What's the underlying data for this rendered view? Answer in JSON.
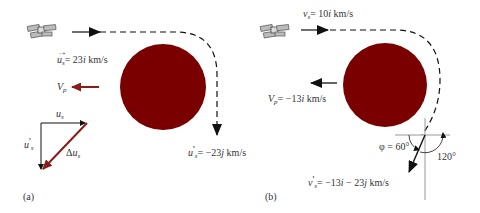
{
  "panel_a": {
    "label": "(a)",
    "incoming_velocity": {
      "symbol": "u",
      "subscript": "s",
      "value": "= 23",
      "unit_vec": "i",
      "unit": " km/s"
    },
    "outgoing_velocity": {
      "symbol": "u",
      "prime": "'",
      "subscript": "s",
      "value": "= −23",
      "unit_vec": "j",
      "unit": " km/s"
    },
    "planet_velocity": {
      "symbol": "V",
      "subscript": "p"
    },
    "vector_triangle": {
      "top_label": {
        "symbol": "u",
        "subscript": "s"
      },
      "left_label": {
        "symbol": "u",
        "prime": "'",
        "subscript": "s"
      },
      "diagonal_label": {
        "prefix": "Δ",
        "symbol": "u",
        "subscript": "s"
      }
    }
  },
  "panel_b": {
    "label": "(b)",
    "incoming_velocity": {
      "symbol": "v",
      "subscript": "s",
      "value": "= 10",
      "unit_vec": "i",
      "unit": " km/s"
    },
    "planet_velocity": {
      "symbol": "V",
      "subscript": "p",
      "value": "= −13",
      "unit_vec": "i",
      "unit": " km/s"
    },
    "outgoing_velocity": {
      "symbol": "v",
      "prime": "'",
      "subscript": "s",
      "value": "= −13",
      "unit_vec1": "i",
      "mid": " − 23",
      "unit_vec2": "j",
      "unit": " km/s"
    },
    "angle_phi": "φ = 60°",
    "angle_120": "120°"
  },
  "colors": {
    "planet": "#7a0000",
    "red_arrow": "#8b1a1a",
    "black": "#111111",
    "text": "#333333",
    "axis": "#999999"
  }
}
